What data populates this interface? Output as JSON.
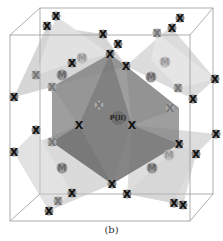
{
  "figure": {
    "caption": "(b)",
    "center_atom": {
      "label": "P(II)",
      "x": 118,
      "y": 118
    },
    "x_atoms": [
      {
        "label": "X",
        "x": 56,
        "y": 16
      },
      {
        "label": "X",
        "x": 47,
        "y": 26
      },
      {
        "label": "X",
        "x": 103,
        "y": 34
      },
      {
        "label": "X",
        "x": 118,
        "y": 44
      },
      {
        "label": "X",
        "x": 110,
        "y": 54
      },
      {
        "label": "X",
        "x": 126,
        "y": 66
      },
      {
        "label": "X",
        "x": 72,
        "y": 63
      },
      {
        "label": "X",
        "x": 14,
        "y": 97
      },
      {
        "label": "X",
        "x": 180,
        "y": 18
      },
      {
        "label": "X",
        "x": 172,
        "y": 28
      },
      {
        "label": "X",
        "x": 215,
        "y": 79
      },
      {
        "label": "X",
        "x": 193,
        "y": 99
      },
      {
        "label": "X",
        "x": 79,
        "y": 125
      },
      {
        "label": "X",
        "x": 132,
        "y": 125
      },
      {
        "label": "X",
        "x": 179,
        "y": 144
      },
      {
        "label": "X",
        "x": 196,
        "y": 154
      },
      {
        "label": "X",
        "x": 14,
        "y": 152
      },
      {
        "label": "X",
        "x": 72,
        "y": 193
      },
      {
        "label": "X",
        "x": 49,
        "y": 211
      },
      {
        "label": "X",
        "x": 112,
        "y": 184
      },
      {
        "label": "X",
        "x": 127,
        "y": 194
      },
      {
        "label": "X",
        "x": 174,
        "y": 203
      },
      {
        "label": "X",
        "x": 183,
        "y": 205
      },
      {
        "label": "X",
        "x": 216,
        "y": 134
      },
      {
        "label": "X",
        "x": 36,
        "y": 130
      }
    ],
    "x_atoms_faint": [
      {
        "label": "X",
        "x": 36,
        "y": 75
      },
      {
        "label": "X",
        "x": 52,
        "y": 87
      },
      {
        "label": "X",
        "x": 99,
        "y": 105
      },
      {
        "label": "X",
        "x": 52,
        "y": 142
      },
      {
        "label": "X",
        "x": 178,
        "y": 88
      },
      {
        "label": "X",
        "x": 58,
        "y": 201
      },
      {
        "label": "X",
        "x": 157,
        "y": 33
      },
      {
        "label": "X",
        "x": 170,
        "y": 108
      }
    ],
    "m_atoms": [
      {
        "label": "M",
        "x": 62,
        "y": 75
      },
      {
        "label": "M",
        "x": 151,
        "y": 77
      },
      {
        "label": "M",
        "x": 62,
        "y": 168
      },
      {
        "label": "M",
        "x": 152,
        "y": 168
      }
    ],
    "m_atoms_faint": [
      {
        "label": "M",
        "x": 82,
        "y": 58
      },
      {
        "label": "M",
        "x": 165,
        "y": 62
      },
      {
        "label": "M",
        "x": 169,
        "y": 155
      }
    ]
  }
}
